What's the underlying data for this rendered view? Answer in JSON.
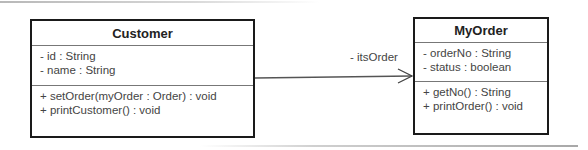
{
  "diagram": {
    "type": "UML class diagram",
    "classes": [
      {
        "name": "Customer",
        "attributes": [
          "- id : String",
          "- name : String"
        ],
        "operations": [
          "+ setOrder(myOrder : Order) : void",
          "+ printCustomer() : void"
        ]
      },
      {
        "name": "MyOrder",
        "attributes": [
          "- orderNo : String",
          "- status : boolean"
        ],
        "operations": [
          "+ getNo() : String",
          "+ printOrder() : void"
        ]
      }
    ],
    "association": {
      "from": "Customer",
      "to": "MyOrder",
      "navigability": "directed (open arrowhead)",
      "role_label": "- itsOrder"
    },
    "colors": {
      "border": "#1a1a1a",
      "divider": "#777777",
      "text": "#444444",
      "line": "#555555"
    }
  }
}
